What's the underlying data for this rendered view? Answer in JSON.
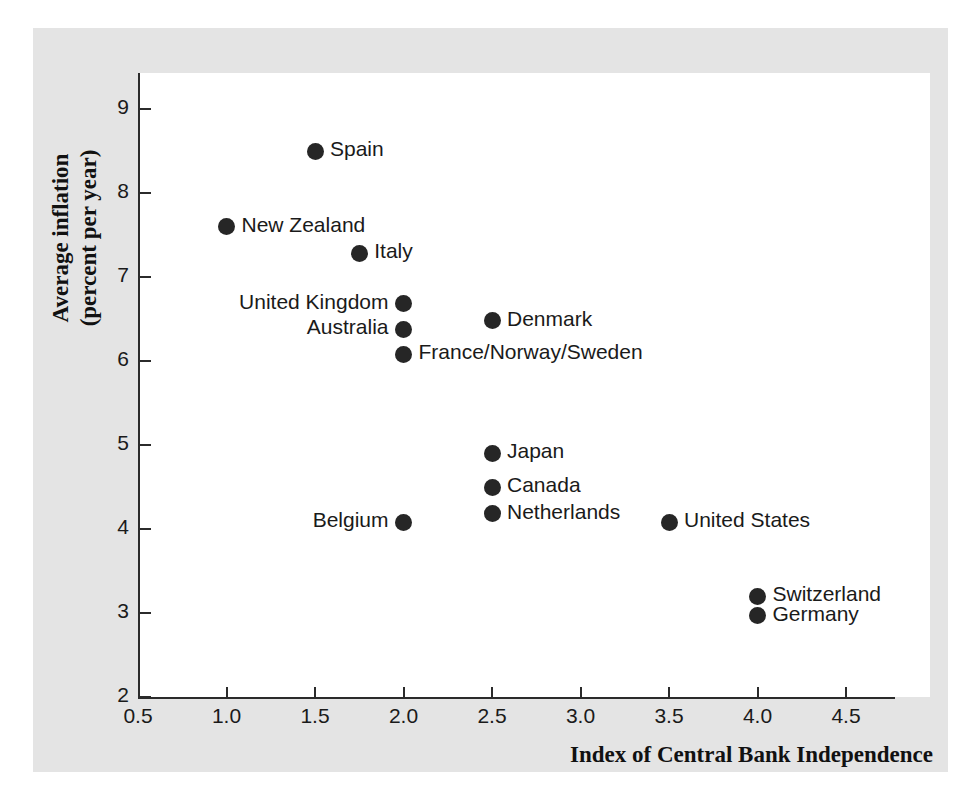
{
  "figure": {
    "background_color": "#e4e4e4",
    "panel_color": "#ffffff",
    "axis_color": "#2b2b2b",
    "marker_color": "#262626"
  },
  "chart_data": {
    "type": "scatter",
    "title": "",
    "xlabel": "Index of Central Bank Independence",
    "ylabel_line1": "Average inflation",
    "ylabel_line2": "(percent per year)",
    "xlim": [
      0.5,
      4.75
    ],
    "ylim": [
      2,
      9.4
    ],
    "xticks": [
      "0.5",
      "1.0",
      "1.5",
      "2.0",
      "2.5",
      "3.0",
      "3.5",
      "4.0",
      "4.5"
    ],
    "xtick_values": [
      0.5,
      1.0,
      1.5,
      2.0,
      2.5,
      3.0,
      3.5,
      4.0,
      4.5
    ],
    "yticks": [
      "2",
      "3",
      "4",
      "5",
      "6",
      "7",
      "8",
      "9"
    ],
    "ytick_values": [
      2,
      3,
      4,
      5,
      6,
      7,
      8,
      9
    ],
    "grid": false,
    "legend": false,
    "points": [
      {
        "label": "Spain",
        "x": 1.5,
        "y": 8.5,
        "label_side": "right"
      },
      {
        "label": "New Zealand",
        "x": 1.0,
        "y": 7.6,
        "label_side": "right"
      },
      {
        "label": "Italy",
        "x": 1.75,
        "y": 7.28,
        "label_side": "right"
      },
      {
        "label": "United Kingdom",
        "x": 2.0,
        "y": 6.68,
        "label_side": "left"
      },
      {
        "label": "Denmark",
        "x": 2.5,
        "y": 6.48,
        "label_side": "right"
      },
      {
        "label": "Australia",
        "x": 2.0,
        "y": 6.38,
        "label_side": "left"
      },
      {
        "label": "France/Norway/Sweden",
        "x": 2.0,
        "y": 6.08,
        "label_side": "right"
      },
      {
        "label": "Japan",
        "x": 2.5,
        "y": 4.9,
        "label_side": "right"
      },
      {
        "label": "Canada",
        "x": 2.5,
        "y": 4.5,
        "label_side": "right"
      },
      {
        "label": "Netherlands",
        "x": 2.5,
        "y": 4.18,
        "label_side": "right"
      },
      {
        "label": "Belgium",
        "x": 2.0,
        "y": 4.08,
        "label_side": "left"
      },
      {
        "label": "United States",
        "x": 3.5,
        "y": 4.08,
        "label_side": "right"
      },
      {
        "label": "Switzerland",
        "x": 4.0,
        "y": 3.2,
        "label_side": "right"
      },
      {
        "label": "Germany",
        "x": 4.0,
        "y": 2.97,
        "label_side": "right"
      }
    ]
  }
}
